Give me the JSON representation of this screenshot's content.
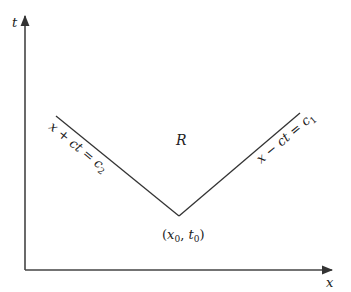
{
  "diagram": {
    "axes": {
      "vertical_label": "t",
      "horizontal_label": "x"
    },
    "region_label": "R",
    "vertex_label": {
      "open": "(",
      "x": "x",
      "x_sub": "0",
      "sep": ", ",
      "t": "t",
      "t_sub": "0",
      "close": ")"
    },
    "left_line_label": {
      "text": "x + ct = c",
      "sub": "2"
    },
    "right_line_label": {
      "text": "x − ct = c",
      "sub": "1"
    },
    "colors": {
      "line": "#333333",
      "text": "#222222",
      "background": "#ffffff"
    }
  }
}
